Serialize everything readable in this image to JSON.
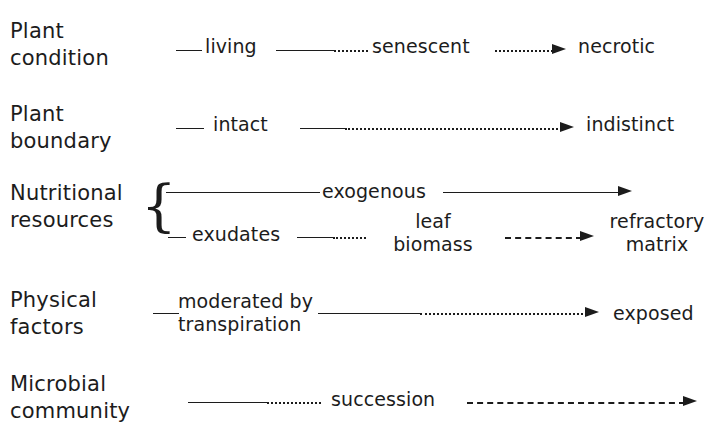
{
  "figure": {
    "type": "conceptual-gradient-diagram",
    "line_styles": {
      "solid": "solid line segment",
      "dotted": "dotted line segment",
      "dashed": "dashed line segment",
      "arrow": "arrowhead pointing right"
    }
  },
  "rows": [
    {
      "id": "plant-condition",
      "label": "Plant\ncondition",
      "nodes": [
        {
          "id": "living",
          "text": "living"
        },
        {
          "id": "senescent",
          "text": "senescent"
        },
        {
          "id": "necrotic",
          "text": "necrotic"
        }
      ]
    },
    {
      "id": "plant-boundary",
      "label": "Plant\nboundary",
      "nodes": [
        {
          "id": "intact",
          "text": "intact"
        },
        {
          "id": "indistinct",
          "text": "indistinct"
        }
      ]
    },
    {
      "id": "nutritional-resources",
      "label": "Nutritional\nresources",
      "brace": "{",
      "nodes": [
        {
          "id": "exogenous",
          "text": "exogenous"
        },
        {
          "id": "exudates",
          "text": "exudates"
        },
        {
          "id": "leaf-biomass",
          "text": "leaf\nbiomass"
        },
        {
          "id": "refractory-matrix",
          "text": "refractory\nmatrix"
        }
      ]
    },
    {
      "id": "physical-factors",
      "label": "Physical\nfactors",
      "nodes": [
        {
          "id": "moderated-by-transpiration",
          "text": "moderated by\ntranspiration"
        },
        {
          "id": "exposed",
          "text": "exposed"
        }
      ]
    },
    {
      "id": "microbial-community",
      "label": "Microbial\ncommunity",
      "nodes": [
        {
          "id": "succession",
          "text": "succession"
        }
      ]
    }
  ],
  "colors": {
    "ink": "#1c1c1c",
    "background": "#ffffff"
  }
}
